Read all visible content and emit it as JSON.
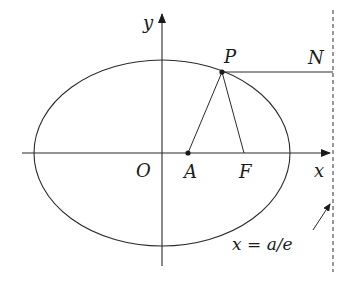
{
  "diagram": {
    "type": "ellipse-directrix",
    "colors": {
      "stroke": "#2a2a2a",
      "background": "#ffffff"
    },
    "axes": {
      "x_label": "x",
      "y_label": "y",
      "origin_label": "O"
    },
    "points": {
      "P": "P",
      "N": "N",
      "A": "A",
      "F": "F"
    },
    "directrix": {
      "label": "x = a/e",
      "style": "dashed"
    },
    "segments": [
      "PA",
      "PF",
      "PN",
      "AF"
    ],
    "geometry": {
      "ellipse": {
        "cx": 162,
        "cy": 153,
        "rx": 128,
        "ry": 93
      },
      "P": [
        222,
        72
      ],
      "A": [
        188,
        153
      ],
      "F": [
        244,
        153
      ],
      "N": [
        333,
        72
      ],
      "directrix_x": 333
    }
  }
}
